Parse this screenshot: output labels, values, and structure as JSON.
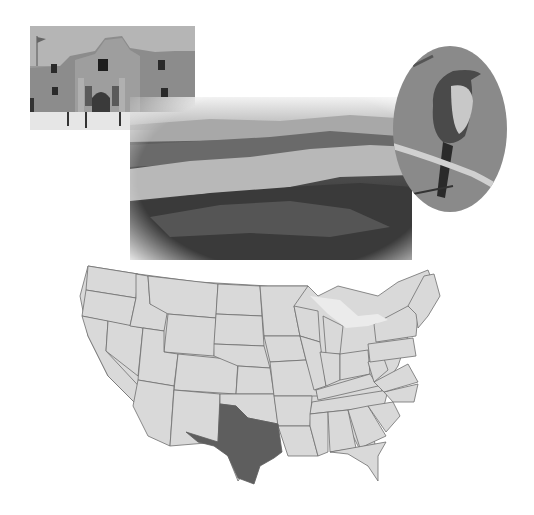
{
  "images": {
    "alamo": {
      "subject": "The Alamo mission building",
      "alt": "Photo of the Alamo"
    },
    "canyon": {
      "subject": "Canyon landscape",
      "alt": "Photo of rugged canyon terrain"
    },
    "bird": {
      "subject": "Mockingbird perched on branch",
      "alt": "Photo of a mockingbird"
    }
  },
  "map": {
    "subject": "Map of contiguous United States",
    "highlighted_state": "Texas",
    "colors": {
      "state_fill": "#d9d9d9",
      "state_border": "#6e6e6e",
      "highlight_fill": "#5e5e5e",
      "water": "#ebebeb"
    }
  }
}
